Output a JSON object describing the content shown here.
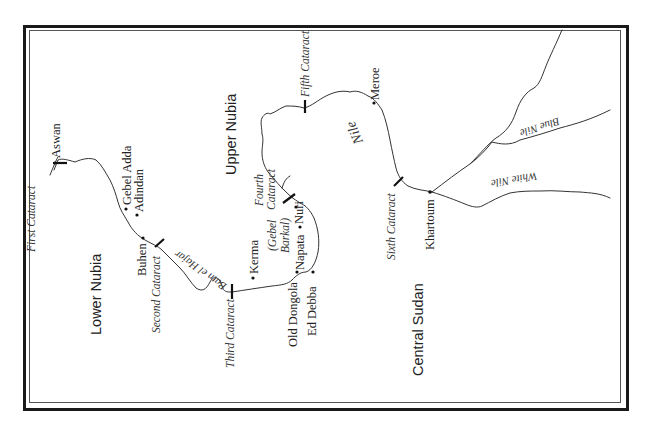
{
  "map": {
    "regions": {
      "lower_nubia": "Lower Nubia",
      "upper_nubia": "Upper Nubia",
      "central_sudan": "Central Sudan"
    },
    "places": {
      "aswan": "Aswan",
      "gebel_adda": "Gebel Adda",
      "adindan": "Adindan",
      "buhen": "Buhen",
      "kerma": "Kerma",
      "old_dongola": "Old Dongola",
      "ed_debba": "Ed Debba",
      "napata": "Napata",
      "gebel_barkal_1": "(Gebel",
      "gebel_barkal_2": "Barkal)",
      "nuri": "Nuri",
      "meroe": "Meroe",
      "khartoum": "Khartoum"
    },
    "cataracts": {
      "first": "First Cataract",
      "second": "Second Cataract",
      "third": "Third Cataract",
      "fourth_1": "Fourth",
      "fourth_2": "Cataract",
      "fifth": "Fifth Cataract",
      "sixth": "Sixth Cataract"
    },
    "rivers": {
      "nile": "Nile",
      "batn": "Batn el Hajar",
      "blue_nile": "Blue Nile",
      "white_nile": "White Nile"
    },
    "colors": {
      "line": "#333333",
      "frame": "#1a1a1a",
      "background": "#ffffff"
    }
  }
}
